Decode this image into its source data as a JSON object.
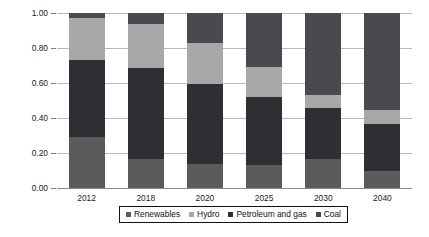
{
  "chart_data": {
    "type": "bar",
    "stacked": true,
    "title": "",
    "xlabel": "",
    "ylabel": "Share of electricity production",
    "ylim": [
      0.0,
      1.0
    ],
    "yticks": [
      "0.00",
      "0.20",
      "0.40",
      "0.60",
      "0.80",
      "1.00"
    ],
    "ytick_values": [
      0.0,
      0.2,
      0.4,
      0.6,
      0.8,
      1.0
    ],
    "grid": true,
    "legend_position": "bottom",
    "categories": [
      "2012",
      "2018",
      "2020",
      "2025",
      "2030",
      "2040"
    ],
    "series": [
      {
        "name": "Renewables",
        "color": "#5b5b5b",
        "values": [
          0.29,
          0.165,
          0.14,
          0.13,
          0.165,
          0.1
        ]
      },
      {
        "name": "Petroleum and gas",
        "color": "#2f2f33",
        "values": [
          0.44,
          0.52,
          0.455,
          0.39,
          0.295,
          0.265
        ]
      },
      {
        "name": "Hydro",
        "color": "#a8a8a8",
        "values": [
          0.24,
          0.25,
          0.235,
          0.17,
          0.07,
          0.08
        ]
      },
      {
        "name": "Coal",
        "color": "#4a4a4e",
        "values": [
          0.03,
          0.065,
          0.17,
          0.31,
          0.47,
          0.555
        ]
      }
    ],
    "stack_order_bottom_to_top": [
      "Renewables",
      "Petroleum and gas",
      "Hydro",
      "Coal"
    ],
    "legend_order": [
      "Renewables",
      "Hydro",
      "Petroleum and gas",
      "Coal"
    ]
  },
  "axis": {
    "y_title": "Share of electricity production"
  },
  "colors": {
    "renewables": "#5b5b5b",
    "petroleum_and_gas": "#2f2f33",
    "hydro": "#a8a8a8",
    "coal": "#4a4a4e",
    "grid": "#b9b9b9",
    "axis": "#8a8a8a",
    "legend_border": "#111111",
    "background": "#ffffff"
  }
}
